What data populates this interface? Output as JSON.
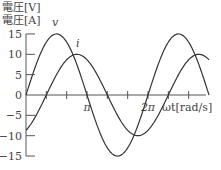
{
  "chart_data": {
    "type": "line",
    "title": "",
    "ylabel_lines": [
      "電圧[V]",
      "電圧[A]"
    ],
    "xlabel": "ωt[rad/s]",
    "x_ticks": [
      {
        "value": 1.0472,
        "label": ""
      },
      {
        "value": 2.0944,
        "label": ""
      },
      {
        "value": 3.1416,
        "label": "π"
      },
      {
        "value": 4.1888,
        "label": ""
      },
      {
        "value": 5.236,
        "label": ""
      },
      {
        "value": 6.2832,
        "label": "2π"
      },
      {
        "value": 7.3304,
        "label": ""
      },
      {
        "value": 8.3776,
        "label": ""
      }
    ],
    "y_ticks": [
      15,
      10,
      5,
      0,
      -5,
      -10,
      -15
    ],
    "xlim": [
      0,
      9.4248
    ],
    "ylim": [
      -15,
      15
    ],
    "grid": false,
    "series": [
      {
        "name": "v",
        "label": "v",
        "formula": "15 sin(ωt)",
        "amplitude": 15,
        "phase": 0,
        "x": [
          0,
          1.5708,
          3.1416,
          4.7124,
          6.2832,
          7.854,
          9.4248
        ],
        "values": [
          0,
          15,
          0,
          -15,
          0,
          15,
          0
        ]
      },
      {
        "name": "i",
        "label": "i",
        "formula": "10 sin(ωt − π/3)",
        "amplitude": 10,
        "phase": -1.0472,
        "x": [
          0,
          1.0472,
          2.618,
          4.1888,
          5.7596,
          7.3304,
          8.9012,
          9.4248
        ],
        "values": [
          -8.66,
          0,
          10,
          0,
          -10,
          0,
          10,
          8.66
        ]
      }
    ],
    "colors": {
      "curve": "#333333",
      "axis": "#555555",
      "text": "#444444"
    }
  }
}
